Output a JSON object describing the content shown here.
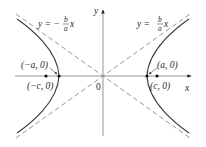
{
  "diagram": {
    "type": "hyperbola",
    "colors": {
      "curve": "#3a3a3a",
      "axis": "#8a8a8a",
      "asymptote": "#8a8a8a",
      "text": "#2a2a2a",
      "point": "#111111"
    },
    "axes": {
      "x_label": "x",
      "y_label": "y",
      "origin_label": "0"
    },
    "asymptotes": {
      "left": {
        "prefix": "y = −",
        "num": "b",
        "den": "a",
        "suffix": "x"
      },
      "right": {
        "prefix": "y = ",
        "num": "b",
        "den": "a",
        "suffix": "x"
      }
    },
    "points": {
      "left_vertex": "(−a, 0)",
      "left_focus": "(−c, 0)",
      "right_vertex": "(a, 0)",
      "right_focus": "(c, 0)"
    }
  }
}
